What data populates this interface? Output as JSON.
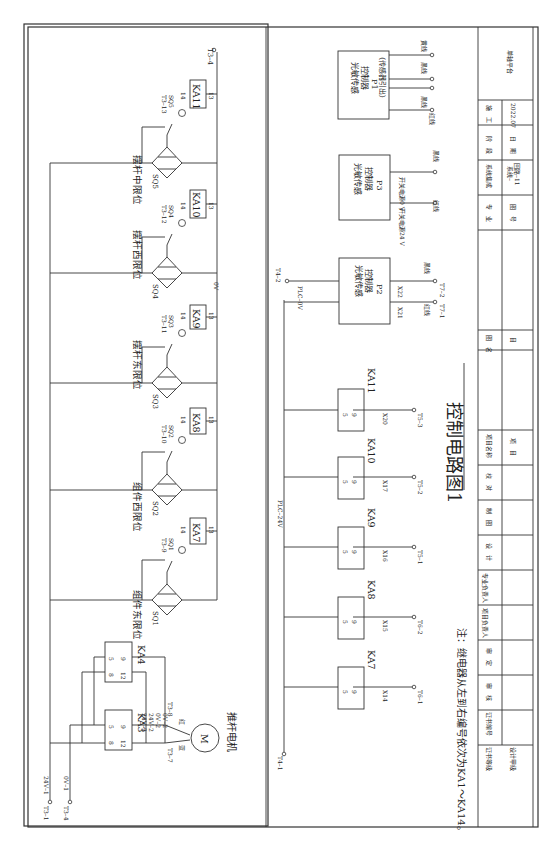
{
  "drawing": {
    "title": "控制电路图1",
    "note": "注：继电器从左到右编号依次为KA1～KA14。",
    "orientation": "rotated 90° clockwise"
  },
  "power": {
    "t3_1": "T3–1",
    "t3_4_left": "T3–4",
    "v24_1": "24V–1",
    "v0_1": "0V–1",
    "t3_4_right": "T3–4",
    "zero_v": "0V"
  },
  "motor": {
    "label": "推杆电机",
    "symbol": "M",
    "red": "红",
    "blue": "蓝",
    "t3_7": "T3–7",
    "t3_8": "T3–8",
    "wires": [
      "24V–2",
      "24V–2",
      "0V–2",
      "0V–2"
    ],
    "relays": [
      {
        "name": "KA3",
        "pins": [
          "8",
          "12",
          "5",
          "9"
        ]
      },
      {
        "name": "KA4",
        "pins": [
          "8",
          "12",
          "5",
          "9"
        ]
      }
    ]
  },
  "sensors": [
    {
      "id": "SQ1",
      "label": "组件东限位",
      "terminal": "T3–9",
      "relay": "KA7",
      "pin_a": "14",
      "pin_b": "13"
    },
    {
      "id": "SQ2",
      "label": "组件西限位",
      "terminal": "T3–10",
      "relay": "KA8",
      "pin_a": "14",
      "pin_b": "13"
    },
    {
      "id": "SQ3",
      "label": "摆杆东限位",
      "terminal": "T3–11",
      "relay": "KA9",
      "pin_a": "14",
      "pin_b": "13"
    },
    {
      "id": "SQ4",
      "label": "摆杆西限位",
      "terminal": "T3–12",
      "relay": "KA10",
      "pin_a": "14",
      "pin_b": "13"
    },
    {
      "id": "SQ5",
      "label": "摆杆中限位",
      "terminal": "T3–13",
      "relay": "KA11",
      "pin_a": "14",
      "pin_b": "13"
    }
  ],
  "plc": {
    "plc_24v": "PLC–24V",
    "plc_0v": "PLC–0V",
    "t4_1": "T4–1",
    "t4_2": "T4–2",
    "outputs": [
      {
        "relay": "KA7",
        "pin_a": "5",
        "pin_b": "9",
        "input": "X14",
        "terminal": "T6–1"
      },
      {
        "relay": "KA8",
        "pin_a": "5",
        "pin_b": "9",
        "input": "X15",
        "terminal": "T6–2"
      },
      {
        "relay": "KA9",
        "pin_a": "5",
        "pin_b": "9",
        "input": "X16",
        "terminal": "T5–1"
      },
      {
        "relay": "KA10",
        "pin_a": "5",
        "pin_b": "9",
        "input": "X17",
        "terminal": "T5–2"
      },
      {
        "relay": "KA11",
        "pin_a": "5",
        "pin_b": "9",
        "input": "X20",
        "terminal": "T5–3"
      }
    ]
  },
  "controllers": {
    "p2": {
      "line1": "光敏传感",
      "line2": "控制器",
      "id": "P2",
      "x21": "X21",
      "x22": "X22",
      "red": "红线",
      "black": "黑线",
      "t7_1": "T7–1",
      "t7_2": "T7–2"
    },
    "p3": {
      "line1": "光敏传感",
      "line2": "控制器",
      "id": "P3",
      "sw24": "开关电源24 V",
      "sw0": "开关电源0 V",
      "red": "红线",
      "black": "黑线"
    },
    "p1": {
      "line1": "光敏传感",
      "line2": "控制器",
      "id": "P1",
      "line3": "（传感器引出）",
      "wires": [
        "红线",
        "黑线",
        "黑线",
        "黄线"
      ]
    }
  },
  "title_block": {
    "project_name_label": "项目名称",
    "project_label": "项　目",
    "drawing_label": "图　名",
    "sub_label": "目",
    "platform": "单轴平台",
    "specialty_label": "专　业",
    "specialty_value": "系统集成",
    "stage_label": "阶　段",
    "stage_value": "施　工",
    "drawing_no_label": "图　号",
    "drawing_no_value": "系统–",
    "drawing_no_value2": "回路–11",
    "date_label": "日　期",
    "date_value": "2022.07",
    "roles": [
      "证书等级",
      "证书编号",
      "审　核",
      "审　定",
      "项目负责人",
      "专业负责人",
      "设　计",
      "制　图",
      "校　对"
    ],
    "cert_grade": "设计甲级"
  }
}
